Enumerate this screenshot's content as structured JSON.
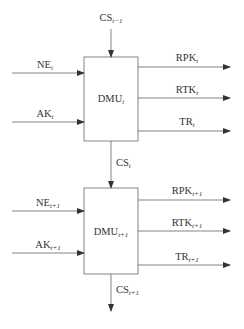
{
  "diagram": {
    "stages": [
      {
        "dmu": {
          "base": "DMU",
          "sub": "t"
        },
        "carry_in": {
          "base": "CS",
          "sub": "t−1"
        },
        "inputs": [
          {
            "base": "NE",
            "sub": "t"
          },
          {
            "base": "AK",
            "sub": "t"
          }
        ],
        "outputs": [
          {
            "base": "RPK",
            "sub": "t"
          },
          {
            "base": "RTK",
            "sub": "t"
          },
          {
            "base": "TR",
            "sub": "t"
          }
        ],
        "carry_out": {
          "base": "CS",
          "sub": "t"
        }
      },
      {
        "dmu": {
          "base": "DMU",
          "sub": "t+1"
        },
        "inputs": [
          {
            "base": "NE",
            "sub": "t+1"
          },
          {
            "base": "AK",
            "sub": "t+1"
          }
        ],
        "outputs": [
          {
            "base": "RPK",
            "sub": "t+1"
          },
          {
            "base": "RTK",
            "sub": "t+1"
          },
          {
            "base": "TR",
            "sub": "t+1"
          }
        ],
        "carry_out": {
          "base": "CS",
          "sub": "t+1"
        }
      }
    ],
    "colors": {
      "line": "#555555",
      "box_border": "#555555",
      "text": "#333333"
    }
  }
}
